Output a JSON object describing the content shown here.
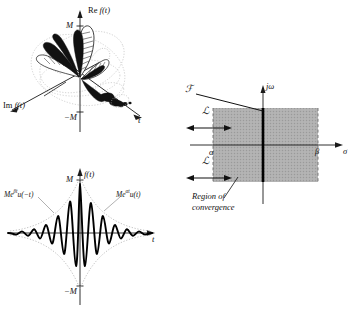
{
  "figure": {
    "colors": {
      "curve": "#000000",
      "axis": "#1a1a1a",
      "envelope": "#b3b3b3",
      "shade": "#a8a8a8",
      "shade_edge": "#8a8a8a",
      "background": "#ffffff"
    }
  },
  "panel_3d": {
    "name": "complex-signal-3d-plot",
    "axes": [
      {
        "id": "re",
        "label": "Re f(t)",
        "label_parts": {
          "prefix": "Re",
          "fn": "f(t)"
        }
      },
      {
        "id": "im",
        "label": "Im f(t)",
        "label_parts": {
          "prefix": "Im",
          "fn": "f(t)"
        }
      },
      {
        "id": "t",
        "label": "t"
      }
    ],
    "ticks": [
      {
        "id": "m-pos",
        "label": "M"
      },
      {
        "id": "m-neg",
        "label": "−M"
      }
    ]
  },
  "panel_time": {
    "name": "time-domain-plot",
    "axes": [
      {
        "id": "f",
        "label": "f(t)"
      },
      {
        "id": "t",
        "label": "t"
      }
    ],
    "ticks": [
      {
        "id": "m-pos",
        "label": "M"
      },
      {
        "id": "m-neg",
        "label": "−M"
      }
    ],
    "envelopes": [
      {
        "id": "left",
        "base": "Me",
        "exponent": "βt",
        "step": "u(−t)",
        "label": "Meβt u(−t)"
      },
      {
        "id": "right",
        "base": "Me",
        "exponent": "αt",
        "step": "u(t)",
        "label": "Meαt u(t)"
      }
    ]
  },
  "panel_roc": {
    "name": "region-of-convergence-plot",
    "axes": [
      {
        "id": "jomega",
        "label": "jω"
      },
      {
        "id": "sigma",
        "label": "σ"
      }
    ],
    "ticks": [
      {
        "id": "alpha",
        "label": "α"
      },
      {
        "id": "beta",
        "label": "β"
      }
    ],
    "transform_label": "ℱ",
    "annotation": {
      "line1": "Region of",
      "line2": "convergence"
    }
  },
  "operators": [
    {
      "id": "laplace-top",
      "symbol": "ℒ"
    },
    {
      "id": "laplace-bottom",
      "symbol": "ℒ"
    }
  ]
}
